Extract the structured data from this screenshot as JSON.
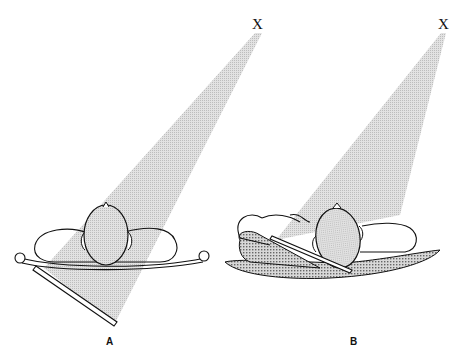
{
  "figure": {
    "panels": [
      {
        "id": "A",
        "label": "A",
        "source_label": "X"
      },
      {
        "id": "B",
        "label": "B",
        "source_label": "X"
      }
    ],
    "colors": {
      "beam": "#d6d6d6",
      "line": "#111111",
      "support_pattern": "#555555",
      "background": "#ffffff"
    }
  }
}
